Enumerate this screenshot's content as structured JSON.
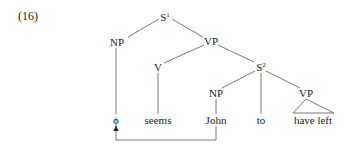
{
  "example_number": "(16)",
  "tree": {
    "root": {
      "label": "S",
      "superscript": "1"
    },
    "nodes": {
      "np_left": "NP",
      "vp_top": "VP",
      "v": "V",
      "s2": {
        "label": "S",
        "superscript": "2"
      },
      "np_john": "NP",
      "vp_right": "VP"
    },
    "leaves": {
      "empty": "ϕ",
      "seems": "seems",
      "john": "John",
      "to": "to",
      "have_left": "have left"
    }
  },
  "movement_arrow": {
    "from": "John",
    "to": "ϕ"
  }
}
